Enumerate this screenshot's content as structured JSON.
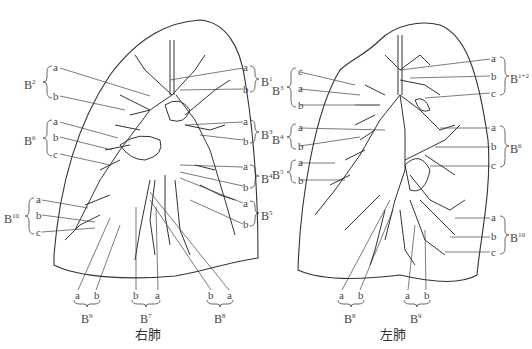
{
  "right_lung": {
    "caption": "右肺",
    "segments_left_side": [
      {
        "name": "B",
        "sup": "2",
        "branches": [
          "a",
          "b"
        ]
      },
      {
        "name": "B",
        "sup": "6",
        "branches": [
          "a",
          "b",
          "c"
        ]
      },
      {
        "name": "B",
        "sup": "10",
        "branches": [
          "a",
          "b",
          "c"
        ]
      }
    ],
    "segments_right_side": [
      {
        "name": "B",
        "sup": "1",
        "branches": [
          "a",
          "b"
        ]
      },
      {
        "name": "B",
        "sup": "3",
        "branches": [
          "a",
          "b"
        ]
      },
      {
        "name": "B",
        "sup": "4",
        "branches": [
          "a",
          "b"
        ]
      },
      {
        "name": "B",
        "sup": "5",
        "branches": [
          "a",
          "b"
        ]
      }
    ],
    "segments_bottom": [
      {
        "name": "B",
        "sup": "9",
        "branches": [
          "a",
          "b"
        ]
      },
      {
        "name": "B",
        "sup": "7",
        "branches": [
          "b",
          "a"
        ]
      },
      {
        "name": "B",
        "sup": "8",
        "branches": [
          "b",
          "a"
        ]
      }
    ]
  },
  "left_lung": {
    "caption": "左肺",
    "segments_left_side": [
      {
        "name": "B",
        "sup": "3",
        "branches": [
          "c",
          "a",
          "b"
        ]
      },
      {
        "name": "B",
        "sup": "4",
        "branches": [
          "a",
          "b"
        ]
      },
      {
        "name": "B",
        "sup": "5",
        "branches": [
          "a",
          "b"
        ]
      }
    ],
    "segments_right_side": [
      {
        "name": "B",
        "sup": "1+2",
        "branches": [
          "a",
          "b",
          "c"
        ]
      },
      {
        "name": "B",
        "sup": "6",
        "branches": [
          "a",
          "b",
          "c"
        ]
      },
      {
        "name": "B",
        "sup": "10",
        "branches": [
          "a",
          "b",
          "c"
        ]
      }
    ],
    "segments_bottom": [
      {
        "name": "B",
        "sup": "8",
        "branches": [
          "a",
          "b"
        ]
      },
      {
        "name": "B",
        "sup": "9",
        "branches": [
          "a",
          "b"
        ]
      }
    ]
  }
}
